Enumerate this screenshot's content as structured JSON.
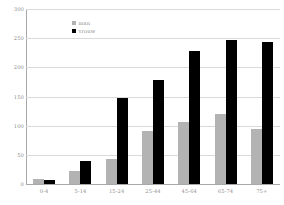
{
  "chart_data": {
    "type": "bar",
    "title": "",
    "subtitle": "",
    "xlabel": "",
    "ylabel": "",
    "categories": [
      "0-4",
      "5-14",
      "15-24",
      "25-44",
      "45-64",
      "65-74",
      "75+"
    ],
    "series": [
      {
        "name": "man",
        "color": "#b3b3b3",
        "values": [
          8,
          22,
          43,
          91,
          106,
          120,
          95
        ]
      },
      {
        "name": "vrouw",
        "color": "#000000",
        "values": [
          7,
          40,
          147,
          178,
          228,
          247,
          244
        ]
      }
    ],
    "ylim": [
      0,
      300
    ],
    "ytick_values": [
      300,
      250,
      200,
      150,
      100,
      50,
      0
    ],
    "ytick_labels": [
      "300",
      "250",
      "200",
      "150",
      "100",
      "50",
      "0"
    ],
    "grid": true,
    "grid_axis": "y",
    "legend_position": "upper-left-inside",
    "annotations": []
  },
  "axes": {
    "y": {
      "ticks": [
        {
          "label": "300",
          "value": 300
        },
        {
          "label": "250",
          "value": 250
        },
        {
          "label": "200",
          "value": 200
        },
        {
          "label": "150",
          "value": 150
        },
        {
          "label": "100",
          "value": 100
        },
        {
          "label": "50",
          "value": 50
        },
        {
          "label": "0",
          "value": 0
        }
      ]
    },
    "x": {
      "ticks": [
        {
          "label": "0-4"
        },
        {
          "label": "5-14"
        },
        {
          "label": "15-24"
        },
        {
          "label": "25-44"
        },
        {
          "label": "45-64"
        },
        {
          "label": "65-74"
        },
        {
          "label": "75+"
        }
      ]
    }
  },
  "legend": {
    "items": [
      {
        "label": "man",
        "color": "#b3b3b3"
      },
      {
        "label": "vrouw",
        "color": "#000000"
      }
    ]
  },
  "style": {
    "background": "#ffffff",
    "gridline_color": "#d9d9d9",
    "axis_color": "#a8a8a8",
    "tick_text_color": "#8c8c8c"
  }
}
